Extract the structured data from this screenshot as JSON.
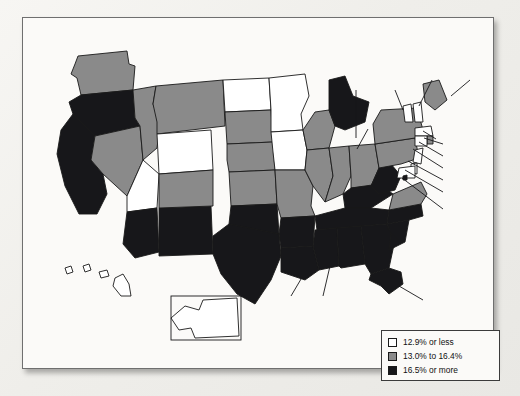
{
  "figure": {
    "type": "choropleth-map",
    "region": "United States"
  },
  "legend": {
    "items": [
      {
        "level": "low",
        "label": "12.9% or less",
        "color": "#ffffff"
      },
      {
        "level": "mid",
        "label": "13.0% to 16.4%",
        "color": "#8a8a8a"
      },
      {
        "level": "high",
        "label": "16.5% or more",
        "color": "#17171a"
      }
    ]
  },
  "chart_data": {
    "type": "heatmap",
    "title": "",
    "xlabel": "",
    "ylabel": "",
    "legend_position": "bottom-right",
    "bins": [
      {
        "level": "low",
        "range": "12.9% or less",
        "color": "#ffffff"
      },
      {
        "level": "mid",
        "range": "13.0% to 16.4%",
        "color": "#8a8a8a"
      },
      {
        "level": "high",
        "range": "16.5% or more",
        "color": "#17171a"
      }
    ],
    "categories": [
      "WA",
      "OR",
      "CA",
      "NV",
      "ID",
      "MT",
      "WY",
      "UT",
      "AZ",
      "NM",
      "CO",
      "ND",
      "SD",
      "NE",
      "KS",
      "OK",
      "TX",
      "MN",
      "IA",
      "MO",
      "AR",
      "LA",
      "WI",
      "IL",
      "MI",
      "IN",
      "OH",
      "KY",
      "TN",
      "MS",
      "AL",
      "GA",
      "FL",
      "SC",
      "NC",
      "VA",
      "WV",
      "PA",
      "NY",
      "VT",
      "NH",
      "ME",
      "MA",
      "RI",
      "CT",
      "NJ",
      "DE",
      "MD",
      "DC",
      "AK",
      "HI"
    ],
    "values": [
      13.5,
      17.2,
      17.0,
      16.4,
      15.9,
      15.5,
      12.6,
      12.8,
      18.7,
      20.8,
      13.7,
      11.2,
      13.4,
      13.0,
      14.0,
      17.2,
      17.9,
      11.4,
      12.7,
      16.2,
      19.8,
      19.9,
      13.2,
      14.7,
      17.4,
      15.6,
      16.3,
      19.4,
      17.8,
      24.2,
      19.0,
      19.1,
      17.1,
      18.3,
      18.0,
      11.7,
      17.8,
      13.7,
      15.9,
      11.8,
      10.0,
      14.7,
      11.9,
      13.7,
      10.7,
      10.8,
      12.0,
      10.3,
      18.2,
      10.1,
      11.6
    ]
  },
  "states": [
    {
      "code": "WA",
      "label": "WA",
      "value": "13.5%",
      "level": "mid",
      "lx": 78,
      "ly": 58,
      "inside": true,
      "textcolor": "dark"
    },
    {
      "code": "OR",
      "label": "OR",
      "value": "17.2%",
      "level": "high",
      "lx": 62,
      "ly": 101,
      "inside": true,
      "textcolor": "light"
    },
    {
      "code": "CA",
      "label": "CA",
      "value": "17.0%",
      "level": "high",
      "lx": 50,
      "ly": 173,
      "inside": true,
      "textcolor": "light"
    },
    {
      "code": "NV",
      "label": "NV",
      "value": "16.4%",
      "level": "mid",
      "lx": 83,
      "ly": 152,
      "inside": true,
      "textcolor": "dark"
    },
    {
      "code": "ID",
      "label": "ID",
      "value": "15.9%",
      "level": "mid",
      "lx": 110,
      "ly": 105,
      "inside": true,
      "textcolor": "dark"
    },
    {
      "code": "MT",
      "label": "MT",
      "value": "15.5%",
      "level": "mid",
      "lx": 158,
      "ly": 55,
      "inside": true,
      "textcolor": "dark"
    },
    {
      "code": "WY",
      "label": "WY",
      "value": "12.6%",
      "level": "low",
      "lx": 143,
      "ly": 122,
      "inside": true,
      "textcolor": "dark"
    },
    {
      "code": "UT",
      "label": "UT",
      "value": "12.8%",
      "level": "low",
      "lx": 115,
      "ly": 160,
      "inside": true,
      "textcolor": "dark"
    },
    {
      "code": "AZ",
      "label": "AZ",
      "value": "18.7%",
      "level": "high",
      "lx": 117,
      "ly": 213,
      "inside": true,
      "textcolor": "light"
    },
    {
      "code": "NM",
      "label": "NM",
      "value": "20.8",
      "level": "high",
      "lx": 162,
      "ly": 210,
      "inside": true,
      "textcolor": "light"
    },
    {
      "code": "CO",
      "label": "CO",
      "value": "13.7%",
      "level": "mid",
      "lx": 173,
      "ly": 165,
      "inside": true,
      "textcolor": "dark"
    },
    {
      "code": "ND",
      "label": "ND",
      "value": "11.2%",
      "level": "low",
      "lx": 213,
      "ly": 79,
      "inside": true,
      "textcolor": "dark"
    },
    {
      "code": "SD",
      "label": "SD",
      "value": "13.4%",
      "level": "mid",
      "lx": 213,
      "ly": 111,
      "inside": true,
      "textcolor": "dark"
    },
    {
      "code": "NE",
      "label": "NE",
      "value": "13.0%",
      "level": "mid",
      "lx": 213,
      "ly": 142,
      "inside": true,
      "textcolor": "dark"
    },
    {
      "code": "KS",
      "label": "KS",
      "value": "14.0%",
      "level": "mid",
      "lx": 216,
      "ly": 172,
      "inside": true,
      "textcolor": "dark"
    },
    {
      "code": "OK",
      "label": "OK",
      "value": "17.2%",
      "level": "high",
      "lx": 214,
      "ly": 205,
      "inside": true,
      "textcolor": "light"
    },
    {
      "code": "TX",
      "label": "TX",
      "value": "17.9%",
      "level": "high",
      "lx": 208,
      "ly": 252,
      "inside": true,
      "textcolor": "light"
    },
    {
      "code": "MN",
      "label": "MN",
      "value": "11.4%",
      "level": "low",
      "lx": 253,
      "ly": 85,
      "inside": true,
      "textcolor": "dark"
    },
    {
      "code": "IA",
      "label": "IA",
      "value": "12.7%",
      "level": "low",
      "lx": 252,
      "ly": 140,
      "inside": true,
      "textcolor": "dark"
    },
    {
      "code": "MO",
      "label": "MO",
      "value": "16.2%",
      "level": "mid",
      "lx": 263,
      "ly": 175,
      "inside": true,
      "textcolor": "dark"
    },
    {
      "code": "AR",
      "label": "AR",
      "value": "19.8%",
      "level": "high",
      "lx": 258,
      "ly": 215,
      "inside": true,
      "textcolor": "light"
    },
    {
      "code": "LA",
      "label": "LA",
      "value": "19.9%",
      "level": "high",
      "lx": 264,
      "ly": 288,
      "inside": false,
      "textcolor": "dark"
    },
    {
      "code": "WI",
      "label": "WI",
      "value": "13.2%",
      "level": "mid",
      "lx": 282,
      "ly": 113,
      "inside": true,
      "textcolor": "dark"
    },
    {
      "code": "IL",
      "label": "IL",
      "value": "14.7%",
      "level": "mid",
      "lx": 283,
      "ly": 157,
      "inside": true,
      "textcolor": "dark"
    },
    {
      "code": "MI",
      "label": "MI",
      "value": "17.4%",
      "level": "high",
      "lx": 333,
      "ly": 62,
      "inside": false,
      "textcolor": "dark"
    },
    {
      "code": "IN",
      "label": "IN",
      "value": "15.6%",
      "level": "mid",
      "lx": 305,
      "ly": 157,
      "inside": true,
      "textcolor": "dark"
    },
    {
      "code": "OH",
      "label": "OH",
      "value": "16.3%",
      "level": "mid",
      "lx": 330,
      "ly": 150,
      "inside": true,
      "textcolor": "dark"
    },
    {
      "code": "KY",
      "label": "KY",
      "value": "19.4%",
      "level": "high",
      "lx": 318,
      "ly": 184,
      "inside": true,
      "textcolor": "light"
    },
    {
      "code": "TN",
      "label": "TN",
      "value": "17.8%",
      "level": "high",
      "lx": 313,
      "ly": 199,
      "inside": true,
      "textcolor": "light"
    },
    {
      "code": "MS",
      "label": "MS",
      "value": "24.2%",
      "level": "high",
      "lx": 300,
      "ly": 288,
      "inside": false,
      "textcolor": "dark"
    },
    {
      "code": "AL",
      "label": "AL",
      "value": "19.0%",
      "level": "high",
      "lx": 318,
      "ly": 228,
      "inside": true,
      "textcolor": "light"
    },
    {
      "code": "GA",
      "label": "GA",
      "value": "19.1%",
      "level": "high",
      "lx": 345,
      "ly": 230,
      "inside": true,
      "textcolor": "light"
    },
    {
      "code": "FL",
      "label": "FL",
      "value": "17.1%",
      "level": "high",
      "lx": 406,
      "ly": 286,
      "inside": false,
      "textcolor": "dark"
    },
    {
      "code": "SC",
      "label": "SC",
      "value": "18.3%",
      "level": "high",
      "lx": 383,
      "ly": 228,
      "inside": false,
      "textcolor": "dark"
    },
    {
      "code": "NC",
      "label": "NC",
      "value": "18.0%",
      "level": "high",
      "lx": 375,
      "ly": 195,
      "inside": true,
      "textcolor": "light"
    },
    {
      "code": "VA",
      "label": "VA",
      "value": "11.7%",
      "level": "mid",
      "lx": 372,
      "ly": 177,
      "inside": true,
      "textcolor": "dark"
    },
    {
      "code": "WV",
      "label": "WV",
      "value": "17.8%",
      "level": "high",
      "lx": 345,
      "ly": 101,
      "inside": false,
      "textcolor": "dark"
    },
    {
      "code": "PA",
      "label": "PA",
      "value": "13.7%",
      "level": "mid",
      "lx": 362,
      "ly": 133,
      "inside": true,
      "textcolor": "dark"
    },
    {
      "code": "NY",
      "label": "NY",
      "value": "15.9%",
      "level": "mid",
      "lx": 381,
      "ly": 113,
      "inside": true,
      "textcolor": "dark"
    },
    {
      "code": "VT",
      "label": "VT",
      "value": "11.8%",
      "level": "low",
      "lx": 369,
      "ly": 62,
      "inside": false,
      "textcolor": "dark"
    },
    {
      "code": "NH",
      "label": "NH",
      "value": "10.0%",
      "level": "low",
      "lx": 409,
      "ly": 52,
      "inside": false,
      "textcolor": "dark"
    },
    {
      "code": "ME",
      "label": "ME",
      "value": "14.7%",
      "level": "mid",
      "lx": 455,
      "ly": 52,
      "inside": false,
      "textcolor": "dark"
    }
  ],
  "callouts": [
    {
      "code": "MA",
      "text": "MA",
      "value": "11.9%",
      "tx": 419,
      "ty": 117
    },
    {
      "code": "RI",
      "text": "RI 13.7%",
      "tx": 425,
      "ty": 129
    },
    {
      "code": "CT",
      "text": "CT 10.7%",
      "tx": 425,
      "ty": 141
    },
    {
      "code": "NJ",
      "text": "NJ 10.8%",
      "tx": 425,
      "ty": 153
    },
    {
      "code": "DE",
      "text": "DE 12.0%",
      "tx": 425,
      "ty": 165
    },
    {
      "code": "MD",
      "text": "MD 10.3%",
      "tx": 425,
      "ty": 177
    },
    {
      "code": "DC1",
      "text": "Washington",
      "tx": 425,
      "ty": 194
    },
    {
      "code": "DC2",
      "text": "D.C. 18.2%",
      "tx": 425,
      "ty": 206
    }
  ],
  "insets": [
    {
      "code": "HI",
      "label": "HI",
      "value": "11.6%",
      "lx": 62,
      "ly": 266
    },
    {
      "code": "AK",
      "label": "AK",
      "value": "10.1%",
      "lx": 199,
      "ly": 292
    }
  ]
}
